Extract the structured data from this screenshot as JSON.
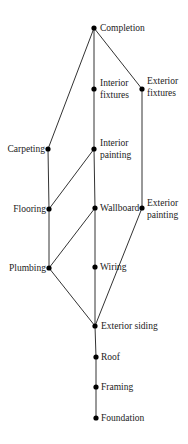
{
  "diagram": {
    "type": "hasse-diagram",
    "colors": {
      "line": "#333333",
      "node": "#000000",
      "text": "#222222",
      "background": "#ffffff"
    },
    "nodes": [
      {
        "id": "completion",
        "label": "Completion",
        "x": 94,
        "y": 28,
        "labelSide": "right",
        "lx": 100,
        "ly": 22
      },
      {
        "id": "interior_fixtures",
        "label": "Interior fixtures",
        "x": 94,
        "y": 89,
        "labelSide": "right",
        "lx": 100,
        "ly": 77,
        "lines": [
          "Interior",
          "fixtures"
        ]
      },
      {
        "id": "exterior_fixtures",
        "label": "Exterior fixtures",
        "x": 142,
        "y": 89,
        "labelSide": "right",
        "lx": 147,
        "ly": 75,
        "lines": [
          "Exterior",
          "fixtures"
        ]
      },
      {
        "id": "carpeting",
        "label": "Carpeting",
        "x": 48,
        "y": 149,
        "labelSide": "left",
        "lx": 2,
        "ly": 143
      },
      {
        "id": "interior_painting",
        "label": "Interior painting",
        "x": 94,
        "y": 149,
        "labelSide": "right",
        "lx": 100,
        "ly": 137,
        "lines": [
          "Interior",
          "painting"
        ]
      },
      {
        "id": "flooring",
        "label": "Flooring",
        "x": 49,
        "y": 209,
        "labelSide": "left",
        "lx": 2,
        "ly": 203
      },
      {
        "id": "wallboard",
        "label": "Wallboard",
        "x": 95,
        "y": 208,
        "labelSide": "right",
        "lx": 100,
        "ly": 202
      },
      {
        "id": "exterior_painting",
        "label": "Exterior painting",
        "x": 142,
        "y": 208,
        "labelSide": "right",
        "lx": 147,
        "ly": 196,
        "lines": [
          "Exterior",
          "painting"
        ]
      },
      {
        "id": "plumbing",
        "label": "Plumbing",
        "x": 49,
        "y": 268,
        "labelSide": "left",
        "lx": 2,
        "ly": 262
      },
      {
        "id": "wiring",
        "label": "Wiring",
        "x": 95,
        "y": 267,
        "labelSide": "right",
        "lx": 100,
        "ly": 261
      },
      {
        "id": "exterior_siding",
        "label": "Exterior siding",
        "x": 95,
        "y": 326,
        "labelSide": "right",
        "lx": 101,
        "ly": 320
      },
      {
        "id": "roof",
        "label": "Roof",
        "x": 96,
        "y": 357,
        "labelSide": "right",
        "lx": 101,
        "ly": 351
      },
      {
        "id": "framing",
        "label": "Framing",
        "x": 96,
        "y": 387,
        "labelSide": "right",
        "lx": 101,
        "ly": 381
      },
      {
        "id": "foundation",
        "label": "Foundation",
        "x": 96,
        "y": 418,
        "labelSide": "right",
        "lx": 101,
        "ly": 412
      }
    ],
    "edges": [
      [
        "completion",
        "carpeting"
      ],
      [
        "completion",
        "interior_fixtures"
      ],
      [
        "completion",
        "exterior_fixtures"
      ],
      [
        "interior_fixtures",
        "interior_painting"
      ],
      [
        "exterior_fixtures",
        "exterior_painting"
      ],
      [
        "carpeting",
        "flooring"
      ],
      [
        "interior_painting",
        "flooring"
      ],
      [
        "interior_painting",
        "wallboard"
      ],
      [
        "flooring",
        "plumbing"
      ],
      [
        "wallboard",
        "plumbing"
      ],
      [
        "wallboard",
        "wiring"
      ],
      [
        "plumbing",
        "exterior_siding"
      ],
      [
        "wiring",
        "exterior_siding"
      ],
      [
        "exterior_painting",
        "exterior_siding"
      ],
      [
        "exterior_siding",
        "roof"
      ],
      [
        "roof",
        "framing"
      ],
      [
        "framing",
        "foundation"
      ]
    ]
  },
  "labels": {
    "completion": "Completion",
    "interior": "Interior",
    "fixtures": "fixtures",
    "exterior": "Exterior",
    "carpeting": "Carpeting",
    "painting": "painting",
    "flooring": "Flooring",
    "wallboard": "Wallboard",
    "plumbing": "Plumbing",
    "wiring": "Wiring",
    "exterior_siding": "Exterior siding",
    "roof": "Roof",
    "framing": "Framing",
    "foundation": "Foundation"
  }
}
